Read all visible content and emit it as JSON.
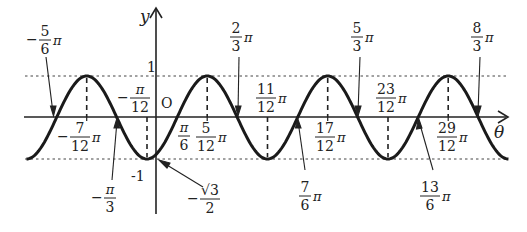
{
  "figure": {
    "function": "y = sin(2θ - π/3)",
    "axes": {
      "x_label": "θ",
      "y_label": "y",
      "origin_label": "O"
    },
    "y_labels": {
      "one": "1",
      "minus_one": "-1",
      "minus_sqrt3_over_2": {
        "sign": "−",
        "numer": "√3",
        "denom": "2"
      }
    },
    "colors": {
      "curve": "#1a1a1a",
      "axis": "#222222",
      "guide": "#444444",
      "background": "#ffffff"
    },
    "zero_labels_above": [
      {
        "id": "neg-5-6",
        "sign": "−",
        "numer": "5",
        "denom": "6",
        "pi": "π",
        "theta": -0.8333
      },
      {
        "id": "2-3",
        "sign": "",
        "numer": "2",
        "denom": "3",
        "pi": "π",
        "theta": 0.6667
      },
      {
        "id": "5-3",
        "sign": "",
        "numer": "5",
        "denom": "3",
        "pi": "π",
        "theta": 1.6667
      },
      {
        "id": "8-3",
        "sign": "",
        "numer": "8",
        "denom": "3",
        "pi": "π",
        "theta": 2.6667
      }
    ],
    "zero_labels_below": [
      {
        "id": "neg-1-3",
        "sign": "−",
        "numer": "π",
        "denom": "3",
        "pi": "",
        "theta": -0.3333
      },
      {
        "id": "7-6",
        "sign": "",
        "numer": "7",
        "denom": "6",
        "pi": "π",
        "theta": 1.1667
      },
      {
        "id": "13-6",
        "sign": "",
        "numer": "13",
        "denom": "6",
        "pi": "π",
        "theta": 2.1667
      }
    ],
    "zero_label_axis": {
      "id": "1-6",
      "sign": "",
      "numer": "π",
      "denom": "6",
      "pi": "",
      "theta": 0.1667
    },
    "max_labels": [
      {
        "id": "neg-7-12",
        "sign": "−",
        "numer": "7",
        "denom": "12",
        "pi": "π",
        "theta": -0.5833
      },
      {
        "id": "5-12",
        "sign": "",
        "numer": "5",
        "denom": "12",
        "pi": "π",
        "theta": 0.4167
      },
      {
        "id": "17-12",
        "sign": "",
        "numer": "17",
        "denom": "12",
        "pi": "π",
        "theta": 1.4167
      },
      {
        "id": "29-12",
        "sign": "",
        "numer": "29",
        "denom": "12",
        "pi": "π",
        "theta": 2.4167
      }
    ],
    "min_labels": [
      {
        "id": "neg-1-12",
        "sign": "−",
        "numer": "π",
        "denom": "12",
        "pi": "",
        "theta": -0.0833
      },
      {
        "id": "11-12",
        "sign": "",
        "numer": "11",
        "denom": "12",
        "pi": "π",
        "theta": 0.9167
      },
      {
        "id": "23-12",
        "sign": "",
        "numer": "23",
        "denom": "12",
        "pi": "π",
        "theta": 1.9167
      }
    ],
    "domain_theta_over_pi": [
      -1.0833,
      2.9167
    ]
  }
}
